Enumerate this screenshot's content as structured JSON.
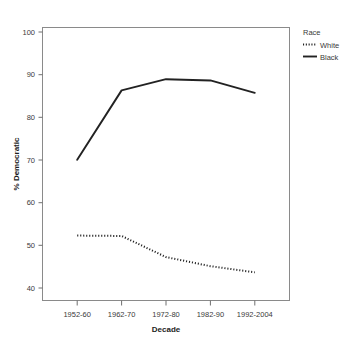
{
  "chart_data": {
    "type": "line",
    "title": "",
    "xlabel": "Decade",
    "ylabel": "% Democratic",
    "categories": [
      "1952-60",
      "1962-70",
      "1972-80",
      "1982-90",
      "1992-2004"
    ],
    "series": [
      {
        "name": "White",
        "style": "dotted",
        "color": "#222222",
        "values": [
          52.7,
          52.6,
          47.5,
          45.3,
          43.8
        ]
      },
      {
        "name": "Black",
        "style": "solid",
        "color": "#222222",
        "values": [
          71.0,
          87.8,
          90.5,
          90.2,
          87.2
        ]
      }
    ],
    "ylim": [
      37,
      103
    ],
    "yticks": [
      40,
      50,
      60,
      70,
      80,
      90,
      100
    ],
    "ytick_labels": [
      "40",
      "50",
      "60",
      "70",
      "80",
      "90",
      "100"
    ],
    "xtick_labels": [
      "1952-60",
      "1962-70",
      "1972-80",
      "1982-90",
      "1992-2004"
    ],
    "grid": false,
    "legend_position": "right",
    "legend_title": "Race",
    "legend_entries": [
      {
        "label": "White",
        "style": "dotted"
      },
      {
        "label": "Black",
        "style": "solid"
      }
    ]
  },
  "axes": {
    "y_title": "% Democratic",
    "x_title": "Decade",
    "y_tick_0": "40",
    "y_tick_1": "50",
    "y_tick_2": "60",
    "y_tick_3": "70",
    "y_tick_4": "80",
    "y_tick_5": "90",
    "y_tick_6": "100",
    "x_tick_0": "1952-60",
    "x_tick_1": "1962-70",
    "x_tick_2": "1972-80",
    "x_tick_3": "1982-90",
    "x_tick_4": "1992-2004"
  },
  "legend": {
    "title": "Race",
    "entry_0": "White",
    "entry_1": "Black"
  }
}
